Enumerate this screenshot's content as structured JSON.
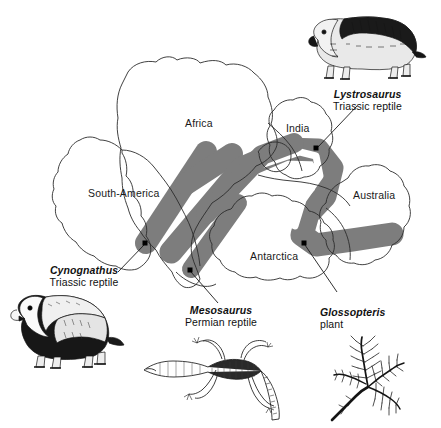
{
  "figure": {
    "background_color": "#ffffff",
    "outline_color": "#2b2b2b",
    "band_color": "#7d7d7d",
    "dot_color": "#000000"
  },
  "map": {
    "continents": [
      {
        "name": "africa",
        "label": "Africa",
        "x": 185,
        "y": 118
      },
      {
        "name": "south-america",
        "label": "South-America",
        "x": 88,
        "y": 188
      },
      {
        "name": "india",
        "label": "India",
        "x": 286,
        "y": 123
      },
      {
        "name": "australia",
        "label": "Australia",
        "x": 353,
        "y": 190
      },
      {
        "name": "antarctica",
        "label": "Antarctica",
        "x": 250,
        "y": 251
      }
    ],
    "fossil_sites": [
      {
        "name": "site-cynognathus",
        "x": 145,
        "y": 243
      },
      {
        "name": "site-mesosaurus",
        "x": 190,
        "y": 270
      },
      {
        "name": "site-lystrosaurus",
        "x": 316,
        "y": 148
      },
      {
        "name": "site-glossopteris",
        "x": 304,
        "y": 243
      }
    ],
    "leader_lines": [
      {
        "name": "leader-lystrosaurus",
        "x1": 357,
        "y1": 106,
        "x2": 318,
        "y2": 147
      },
      {
        "name": "leader-cynognathus",
        "x1": 118,
        "y1": 272,
        "x2": 144,
        "y2": 245
      },
      {
        "name": "leader-mesosaurus",
        "x1": 218,
        "y1": 303,
        "x2": 191,
        "y2": 272
      },
      {
        "name": "leader-glossopteris",
        "x1": 337,
        "y1": 292,
        "x2": 305,
        "y2": 245
      }
    ]
  },
  "fossils": [
    {
      "name": "lystrosaurus",
      "genus": "Lystrosaurus",
      "description": "Triassic reptile",
      "caption_x": 320,
      "caption_y": 88,
      "illus_x": 300,
      "illus_y": 10,
      "align": "center"
    },
    {
      "name": "cynognathus",
      "genus": "Cynognathus",
      "description": "Triassic reptile",
      "caption_x": 30,
      "caption_y": 264,
      "illus_x": 8,
      "illus_y": 292,
      "align": "center"
    },
    {
      "name": "mesosaurus",
      "genus": "Mesosaurus",
      "description": "Permian reptile",
      "caption_x": 165,
      "caption_y": 304,
      "illus_x": 140,
      "illus_y": 330,
      "align": "center"
    },
    {
      "name": "glossopteris",
      "genus": "Glossopteris",
      "description": "plant",
      "caption_x": 320,
      "caption_y": 306,
      "illus_x": 326,
      "illus_y": 332,
      "align": "left"
    }
  ]
}
